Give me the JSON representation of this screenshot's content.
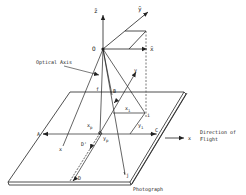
{
  "figure": {
    "type": "aerial photograph geometry diagram",
    "labels": {
      "z_bar": "z̄",
      "y_bar": "ȳ",
      "x_bar": "x̄",
      "origin": "O",
      "optical_axis": "Optical Axis",
      "focal_length": "f",
      "point_B": "B",
      "axis_y": "y",
      "x_i": "x",
      "x_i_sub": "i",
      "point_i": "i",
      "y_i": "y",
      "y_i_sub": "i",
      "x_p": "x",
      "x_p_sub": "p",
      "y_p": "y",
      "y_p_sub": "p",
      "point_A": "A",
      "point_C": "C",
      "axis_x_small": "x",
      "point_D_prime": "D'",
      "point_D": "D",
      "point_j": "j",
      "direction_line1": "Direction of",
      "direction_line2": "Flight",
      "axis_x": "x",
      "photograph": "Photograph"
    },
    "colors": {
      "line": "#222222",
      "dash": "#555555",
      "background": "#ffffff"
    }
  }
}
